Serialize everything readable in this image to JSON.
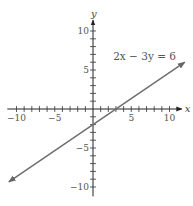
{
  "chart_data": {
    "type": "line",
    "title": "",
    "xlabel": "x",
    "ylabel": "y",
    "xlim": [
      -11,
      11
    ],
    "ylim": [
      -11,
      11
    ],
    "grid": false,
    "x_ticks": [
      -10,
      -5,
      5,
      10
    ],
    "y_ticks": [
      10,
      5,
      -5,
      -10
    ],
    "x_tick_labels": [
      "−10",
      "−5",
      "5",
      "10"
    ],
    "y_tick_labels": [
      "10",
      "5",
      "−5",
      "−10"
    ],
    "series": [
      {
        "name": "2x − 3y = 6",
        "equation": "2x - 3y = 6",
        "x": [
          -11,
          12
        ],
        "y": [
          -9.33,
          6
        ],
        "arrows_both_ends": true
      }
    ],
    "annotations": [
      {
        "text": "2x − 3y = 6",
        "x": 7,
        "y": 6.5
      }
    ]
  }
}
